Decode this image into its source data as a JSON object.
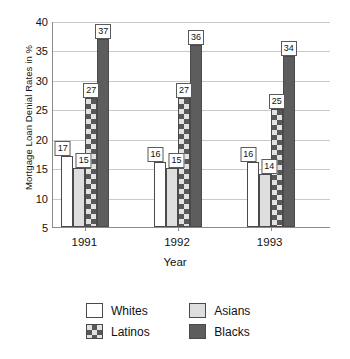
{
  "chart_data": {
    "type": "bar",
    "title": "",
    "xlabel": "Year",
    "ylabel": "Mortgage Loan Denial Rates in %",
    "categories": [
      "1991",
      "1992",
      "1993"
    ],
    "series": [
      {
        "name": "Whites",
        "values": [
          17,
          16,
          16
        ],
        "color": "#ffffff",
        "pattern": "solid"
      },
      {
        "name": "Asians",
        "values": [
          15,
          15,
          14
        ],
        "color": "#dedede",
        "pattern": "solid"
      },
      {
        "name": "Latinos",
        "values": [
          27,
          27,
          25
        ],
        "color": "#e2e2e2",
        "pattern": "checkered"
      },
      {
        "name": "Blacks",
        "values": [
          37,
          36,
          34
        ],
        "color": "#5d5d5d",
        "pattern": "solid"
      }
    ],
    "ylim": [
      5,
      40
    ],
    "yticks": [
      "5",
      "10",
      "15",
      "20",
      "25",
      "30",
      "35",
      "40"
    ],
    "grid": true,
    "legend_position": "bottom",
    "data_labels": true
  },
  "legend": {
    "entries": [
      {
        "label": "Whites"
      },
      {
        "label": "Asians"
      },
      {
        "label": "Latinos"
      },
      {
        "label": "Blacks"
      }
    ]
  }
}
